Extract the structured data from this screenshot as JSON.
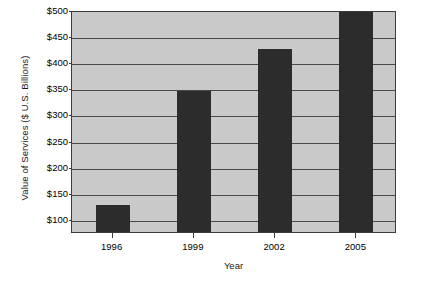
{
  "chart_data": {
    "type": "bar",
    "title": "",
    "subtitle": "",
    "xlabel": "Year",
    "ylabel": "Value of Services ($ U.S. Billions)",
    "categories": [
      "1996",
      "1999",
      "2002",
      "2005"
    ],
    "values": [
      130,
      348,
      430,
      500
    ],
    "value_labels": [
      "",
      "",
      "",
      ""
    ],
    "ylim": [
      75,
      500
    ],
    "ytick_values": [
      100,
      150,
      200,
      250,
      300,
      350,
      400,
      450,
      500
    ],
    "ytick_labels": [
      "$100",
      "$150",
      "$200",
      "$250",
      "$300",
      "$350",
      "$400",
      "$450",
      "$500"
    ],
    "grid": true,
    "grid_axis": "y",
    "legend": false,
    "legend_position": "none",
    "annotations": [],
    "colors": {
      "bar": "#2c2c2c",
      "plot_background": "#c9c9c9",
      "figure_background": "#ffffff",
      "gridline": "#4a4a4a",
      "axis": "#3c3c3c",
      "text": "#000000"
    }
  }
}
